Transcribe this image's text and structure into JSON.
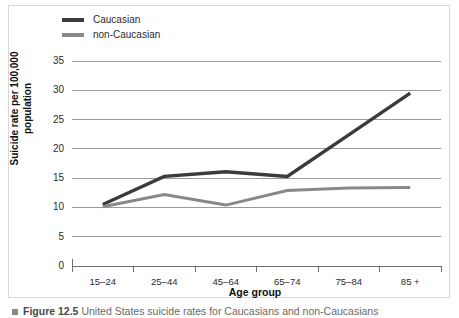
{
  "figure": {
    "caption_bullet": "square-bullet",
    "caption_number": "Figure 12.5",
    "caption_text": "United States suicide rates for Caucasians and non-Caucasians"
  },
  "chart_data": {
    "type": "line",
    "title": "",
    "xlabel": "Age group",
    "ylabel": "Suicide rate per 100,000 population",
    "ylabel_line1": "Suicide rate per 100,000",
    "ylabel_line2": "population",
    "categories": [
      "15–24",
      "25–44",
      "45–64",
      "65–74",
      "75–84",
      "85 +"
    ],
    "ylim": [
      0,
      35
    ],
    "yticks": [
      0,
      5,
      10,
      15,
      20,
      25,
      30,
      35
    ],
    "ytick_labels": [
      "0",
      "5",
      "10",
      "15",
      "20",
      "25",
      "30",
      "35"
    ],
    "grid": true,
    "legend_position": "top-left",
    "series": [
      {
        "name": "Caucasian",
        "color": "#3b3b3b",
        "values": [
          10.5,
          15.3,
          16.1,
          15.3,
          22.4,
          29.5
        ]
      },
      {
        "name": "non-Caucasian",
        "color": "#888888",
        "values": [
          10.1,
          12.2,
          10.4,
          12.9,
          13.3,
          13.4
        ]
      }
    ]
  },
  "colors": {
    "caucasian": "#3b3b3b",
    "non_caucasian": "#888888",
    "gridline": "#9a9a9a",
    "axis": "#6e6e6e",
    "frame": "#d8d8d8",
    "text": "#2b2b2b"
  }
}
